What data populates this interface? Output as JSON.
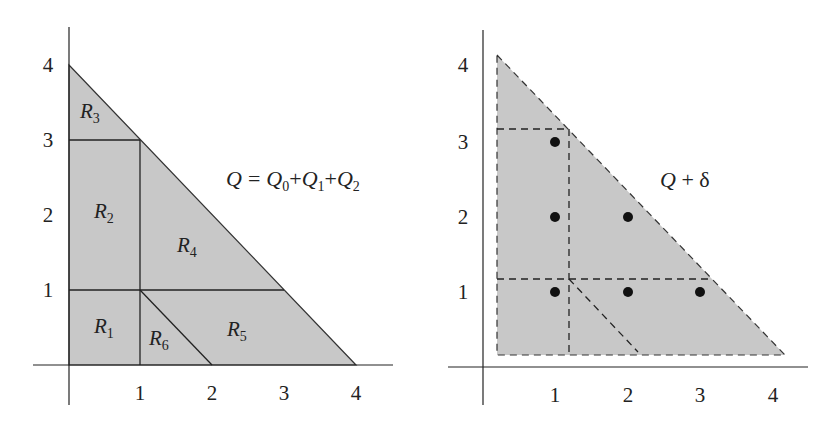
{
  "colors": {
    "fill": "#c8c8c8",
    "line": "#222222",
    "dot": "#111111"
  },
  "left_panel": {
    "equation": {
      "lhs": "Q",
      "equals": "=",
      "t0": "Q",
      "s0": "0",
      "plus1": "+",
      "t1": "Q",
      "s1": "1",
      "plus2": "+",
      "t2": "Q",
      "s2": "2"
    },
    "x_ticks": [
      "1",
      "2",
      "3",
      "4"
    ],
    "y_ticks": [
      "1",
      "2",
      "3",
      "4"
    ],
    "regions": [
      {
        "name": "R",
        "sub": "1"
      },
      {
        "name": "R",
        "sub": "2"
      },
      {
        "name": "R",
        "sub": "3"
      },
      {
        "name": "R",
        "sub": "4"
      },
      {
        "name": "R",
        "sub": "5"
      },
      {
        "name": "R",
        "sub": "6"
      }
    ]
  },
  "right_panel": {
    "label": {
      "q": "Q",
      "rest": " + δ"
    },
    "x_ticks": [
      "1",
      "2",
      "3",
      "4"
    ],
    "y_ticks": [
      "1",
      "2",
      "3",
      "4"
    ],
    "points": [
      [
        1,
        1
      ],
      [
        2,
        1
      ],
      [
        3,
        1
      ],
      [
        1,
        2
      ],
      [
        2,
        2
      ],
      [
        1,
        3
      ]
    ]
  }
}
